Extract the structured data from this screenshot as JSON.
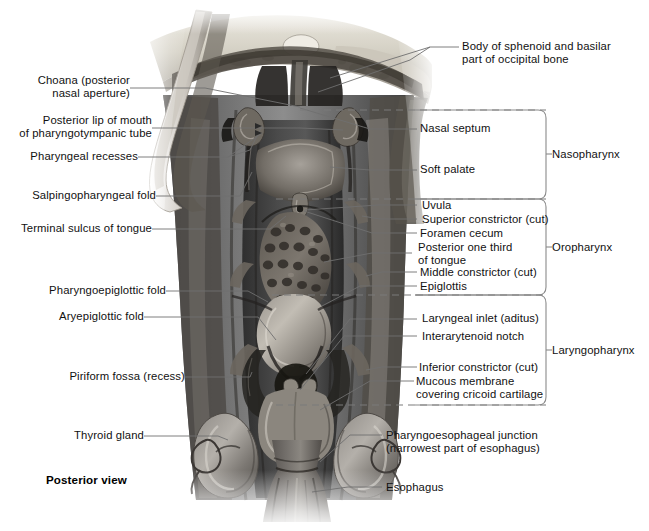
{
  "figure": {
    "view_note": "Posterior view",
    "orientation": "posterior"
  },
  "labels_left": [
    {
      "id": "choana",
      "text": "Choana (posterior\nnasal aperture)"
    },
    {
      "id": "posterior-lip",
      "text": "Posterior lip of mouth\nof pharyngotympanic tube"
    },
    {
      "id": "pharyngeal-recesses",
      "text": "Pharyngeal recesses"
    },
    {
      "id": "salpingopharyngeal",
      "text": "Salpingopharyngeal fold"
    },
    {
      "id": "terminal-sulcus",
      "text": "Terminal sulcus of tongue"
    },
    {
      "id": "pharyngoepiglottic",
      "text": "Pharyngoepiglottic fold"
    },
    {
      "id": "aryepiglottic",
      "text": "Aryepiglottic fold"
    },
    {
      "id": "piriform-fossa",
      "text": "Piriform fossa (recess)"
    },
    {
      "id": "thyroid-gland",
      "text": "Thyroid gland"
    }
  ],
  "labels_right": [
    {
      "id": "sphenoid-basilar",
      "text": "Body of sphenoid and basilar\npart of occipital bone"
    },
    {
      "id": "nasal-septum",
      "text": "Nasal septum"
    },
    {
      "id": "soft-palate",
      "text": "Soft palate"
    },
    {
      "id": "uvula",
      "text": "Uvula"
    },
    {
      "id": "superior-constrictor",
      "text": "Superior constrictor (cut)"
    },
    {
      "id": "foramen-cecum",
      "text": "Foramen cecum"
    },
    {
      "id": "posterior-third",
      "text": "Posterior one third\nof tongue"
    },
    {
      "id": "middle-constrictor",
      "text": "Middle constrictor (cut)"
    },
    {
      "id": "epiglottis",
      "text": "Epiglottis"
    },
    {
      "id": "laryngeal-inlet",
      "text": "Laryngeal inlet (aditus)"
    },
    {
      "id": "interarytenoid-notch",
      "text": "Interarytenoid notch"
    },
    {
      "id": "inferior-constrictor",
      "text": "Inferior constrictor (cut)"
    },
    {
      "id": "mucous-membrane",
      "text": "Mucous membrane\ncovering cricoid cartilage"
    },
    {
      "id": "pharyngoesophageal",
      "text": "Pharyngoesophageal junction\n(narrowest part of esophagus)"
    },
    {
      "id": "esophagus",
      "text": "Esophagus"
    }
  ],
  "regions": [
    {
      "id": "nasopharynx",
      "label": "Nasopharynx"
    },
    {
      "id": "oropharynx",
      "label": "Oropharynx"
    },
    {
      "id": "laryngopharynx",
      "label": "Laryngopharynx"
    }
  ],
  "colors": {
    "background": "#ffffff",
    "text": "#111111",
    "leader_line": "#6f6f6f",
    "bracket_line": "#8a8a8a",
    "dash_line": "#7a7a7a"
  }
}
